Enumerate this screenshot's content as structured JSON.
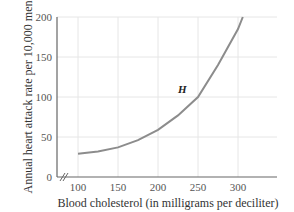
{
  "chart_data": {
    "type": "line",
    "title": "",
    "xlabel": "Blood cholesterol (in milligrams per deciliter)",
    "ylabel": "Annual heart attack rate per 10,000 men",
    "xlim": [
      75,
      345
    ],
    "ylim": [
      0,
      200
    ],
    "x_ticks": [
      "100",
      "150",
      "200",
      "250",
      "300"
    ],
    "y_ticks": [
      "0",
      "50",
      "100",
      "150",
      "200"
    ],
    "grid": true,
    "axis_break": true,
    "series": [
      {
        "name": "H",
        "x": [
          100,
          125,
          150,
          175,
          200,
          225,
          250,
          275,
          300,
          306
        ],
        "values": [
          29,
          32,
          37,
          46,
          59,
          77,
          100,
          140,
          185,
          200
        ]
      }
    ],
    "annotations": [
      {
        "text": "H",
        "x": 235,
        "y": 112
      }
    ],
    "color": "#888888"
  }
}
